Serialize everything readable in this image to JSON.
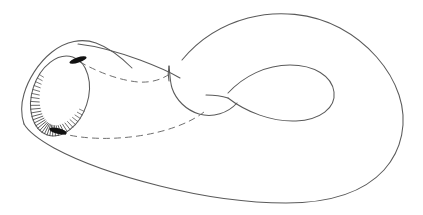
{
  "figure": {
    "title": "Klein bottle immersion diagram",
    "medium": "pencil line drawing, scanned",
    "background_color": "#ffffff",
    "line_color": "#5a5a5a",
    "hidden_line_color": "#6f6f6f",
    "accent_color": "#111111",
    "canvas": {
      "width": 423,
      "height": 215
    },
    "parts": [
      {
        "name": "outer-body-top-edge",
        "kind": "solid-contour"
      },
      {
        "name": "outer-body-bottom-edge",
        "kind": "solid-contour"
      },
      {
        "name": "tube-mouth-ellipse",
        "kind": "solid-contour"
      },
      {
        "name": "tube-mouth-hatching",
        "kind": "hatch-shading",
        "tick_count": 34
      },
      {
        "name": "neck-top-edge",
        "kind": "solid-contour"
      },
      {
        "name": "neck-outer-wall",
        "kind": "solid-contour"
      },
      {
        "name": "inner-teardrop-loop",
        "kind": "solid-contour"
      },
      {
        "name": "hidden-upper-contour",
        "kind": "dashed-contour"
      },
      {
        "name": "hidden-lower-contour",
        "kind": "dashed-contour"
      },
      {
        "name": "mouth-blot-upper",
        "kind": "ink-blot"
      },
      {
        "name": "mouth-blot-lower",
        "kind": "ink-blot"
      }
    ],
    "geometry": {
      "mouth_ellipse": {
        "center_x": 60,
        "center_y": 96,
        "radius_major": 41,
        "radius_minor": 28,
        "rotation_deg": -72
      },
      "hatch_arc_degrees": [
        100,
        290
      ],
      "blot_upper": {
        "x": 78,
        "y": 60
      },
      "blot_lower": {
        "x": 58,
        "y": 131
      },
      "body_extent": {
        "min_x": 21,
        "max_x": 403,
        "min_y": 13,
        "max_y": 203
      }
    }
  }
}
